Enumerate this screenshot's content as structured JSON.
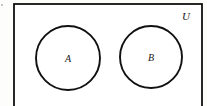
{
  "figure": {
    "kind": "venn-diagram",
    "width": 207,
    "height": 106
  },
  "universe": {
    "label": "U",
    "label_x": 186,
    "label_y": 20,
    "rect": {
      "x": 14,
      "y": 4,
      "width": 188,
      "height": 108
    },
    "stroke_color": "#111111",
    "fill_color": "#ffffff"
  },
  "sets": [
    {
      "label": "A",
      "cx": 68,
      "cy": 58,
      "r": 32,
      "label_x": 68,
      "label_y": 62,
      "stroke_color": "#111111",
      "fill_color": "#ffffff"
    },
    {
      "label": "B",
      "cx": 151,
      "cy": 57,
      "r": 31,
      "label_x": 151,
      "label_y": 61,
      "stroke_color": "#111111",
      "fill_color": "#ffffff"
    }
  ],
  "artifact": {
    "name": "scan-speck",
    "x": 2,
    "y": 5,
    "color": "#b9b9b9"
  },
  "canvas": {
    "background_color": "#fdfdfc"
  }
}
